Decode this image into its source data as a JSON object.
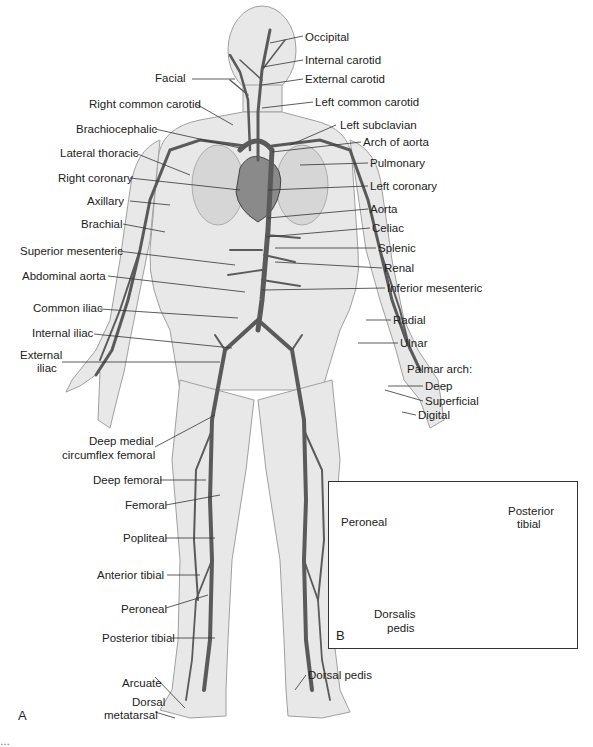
{
  "figure": {
    "panels": [
      {
        "id": "A",
        "label": "A",
        "description": "Anterior view of the systemic arteries of the human body"
      },
      {
        "id": "B",
        "label": "B",
        "description": "Inset: arteries of the foot"
      }
    ],
    "colors": {
      "artery": "#5a5a5a",
      "body_fill": "#e6e6e6",
      "body_outline": "#9a9a9a",
      "label_text": "#222222",
      "leader_line": "#333333"
    }
  },
  "labels_left": [
    {
      "text": "Facial",
      "x": 155,
      "y": 72
    },
    {
      "text": "Right common carotid",
      "x": 89,
      "y": 98
    },
    {
      "text": "Brachiocephalic",
      "x": 76,
      "y": 123
    },
    {
      "text": "Lateral thoracic",
      "x": 60,
      "y": 147
    },
    {
      "text": "Right coronary",
      "x": 58,
      "y": 172
    },
    {
      "text": "Axillary",
      "x": 87,
      "y": 195
    },
    {
      "text": "Brachial",
      "x": 81,
      "y": 218
    },
    {
      "text": "Superior mesenteric",
      "x": 20,
      "y": 245
    },
    {
      "text": "Abdominal aorta",
      "x": 22,
      "y": 270
    },
    {
      "text": "Common iliac",
      "x": 33,
      "y": 302
    },
    {
      "text": "Internal iliac",
      "x": 32,
      "y": 327
    },
    {
      "text": "External",
      "x": 20,
      "y": 349
    },
    {
      "text": "iliac",
      "x": 37,
      "y": 362
    },
    {
      "text": "Deep medial",
      "x": 89,
      "y": 435
    },
    {
      "text": "circumflex femoral",
      "x": 62,
      "y": 449
    },
    {
      "text": "Deep femoral",
      "x": 93,
      "y": 474
    },
    {
      "text": "Femoral",
      "x": 125,
      "y": 499
    },
    {
      "text": "Popliteal",
      "x": 123,
      "y": 532
    },
    {
      "text": "Anterior tibial",
      "x": 97,
      "y": 569
    },
    {
      "text": "Peroneal",
      "x": 121,
      "y": 603
    },
    {
      "text": "Posterior tibial",
      "x": 102,
      "y": 632
    },
    {
      "text": "Arcuate",
      "x": 122,
      "y": 677
    },
    {
      "text": "Dorsal",
      "x": 132,
      "y": 696
    },
    {
      "text": "metatarsal",
      "x": 104,
      "y": 709
    }
  ],
  "labels_right": [
    {
      "text": "Occipital",
      "x": 305,
      "y": 31
    },
    {
      "text": "Internal carotid",
      "x": 305,
      "y": 54
    },
    {
      "text": "External carotid",
      "x": 305,
      "y": 73
    },
    {
      "text": "Left common carotid",
      "x": 315,
      "y": 96
    },
    {
      "text": "Left subclavian",
      "x": 340,
      "y": 119
    },
    {
      "text": "Arch of aorta",
      "x": 363,
      "y": 136
    },
    {
      "text": "Pulmonary",
      "x": 370,
      "y": 157
    },
    {
      "text": "Left coronary",
      "x": 370,
      "y": 180
    },
    {
      "text": "Aorta",
      "x": 370,
      "y": 203
    },
    {
      "text": "Celiac",
      "x": 372,
      "y": 222
    },
    {
      "text": "Splenic",
      "x": 378,
      "y": 242
    },
    {
      "text": "Renal",
      "x": 384,
      "y": 262
    },
    {
      "text": "Inferior mesenteric",
      "x": 387,
      "y": 282
    },
    {
      "text": "Radial",
      "x": 393,
      "y": 314
    },
    {
      "text": "Ulnar",
      "x": 400,
      "y": 337
    },
    {
      "text": "Palmar arch:",
      "x": 407,
      "y": 363
    },
    {
      "text": "Deep",
      "x": 425,
      "y": 380
    },
    {
      "text": "Superficial",
      "x": 425,
      "y": 395
    },
    {
      "text": "Digital",
      "x": 418,
      "y": 409
    },
    {
      "text": "Dorsal pedis",
      "x": 308,
      "y": 669
    }
  ],
  "inset_labels": [
    {
      "text": "Peroneal",
      "x": 341,
      "y": 516
    },
    {
      "text": "Posterior",
      "x": 508,
      "y": 505
    },
    {
      "text": "tibial",
      "x": 517,
      "y": 518
    },
    {
      "text": "Dorsalis",
      "x": 374,
      "y": 608
    },
    {
      "text": "pedis",
      "x": 387,
      "y": 622
    }
  ],
  "caption": {
    "text": "…"
  }
}
